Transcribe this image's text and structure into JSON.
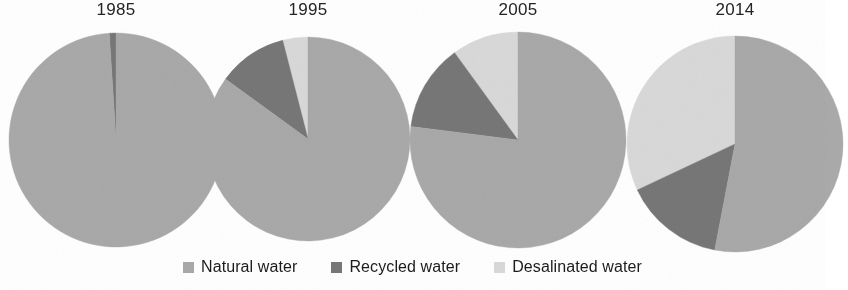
{
  "chart_data": {
    "type": "pie",
    "title": "",
    "subtitle": "",
    "xlabel": "",
    "ylabel": "",
    "grid": false,
    "legend_position": "bottom",
    "direction": "counterclockwise",
    "start_angle_deg": 90,
    "categories": [
      "Natural water",
      "Recycled water",
      "Desalinated water"
    ],
    "colors": {
      "natural_water": "#a9a9a9",
      "recycled_water": "#777777",
      "desalinated_water": "#d9d9d9"
    },
    "panels": [
      {
        "title": "1985",
        "center": {
          "x": 116,
          "y": 140
        },
        "radius": 107,
        "slices": [
          {
            "label": "Desalinated water",
            "value": 0,
            "color_key": "desalinated_water"
          },
          {
            "label": "Recycled water",
            "value": 1,
            "color_key": "recycled_water"
          },
          {
            "label": "Natural water",
            "value": 99,
            "color_key": "natural_water"
          }
        ]
      },
      {
        "title": "1995",
        "center": {
          "x": 308,
          "y": 139
        },
        "radius": 102,
        "slices": [
          {
            "label": "Desalinated water",
            "value": 4,
            "color_key": "desalinated_water"
          },
          {
            "label": "Recycled water",
            "value": 11,
            "color_key": "recycled_water"
          },
          {
            "label": "Natural water",
            "value": 85,
            "color_key": "natural_water"
          }
        ]
      },
      {
        "title": "2005",
        "center": {
          "x": 518,
          "y": 140
        },
        "radius": 108,
        "slices": [
          {
            "label": "Desalinated water",
            "value": 10,
            "color_key": "desalinated_water"
          },
          {
            "label": "Recycled water",
            "value": 13,
            "color_key": "recycled_water"
          },
          {
            "label": "Natural water",
            "value": 77,
            "color_key": "natural_water"
          }
        ]
      },
      {
        "title": "2014",
        "center": {
          "x": 735,
          "y": 144
        },
        "radius": 108,
        "slices": [
          {
            "label": "Desalinated water",
            "value": 32,
            "color_key": "desalinated_water"
          },
          {
            "label": "Recycled water",
            "value": 15,
            "color_key": "recycled_water"
          },
          {
            "label": "Natural water",
            "value": 53,
            "color_key": "natural_water"
          }
        ]
      }
    ]
  },
  "legend": {
    "items": [
      {
        "label": "Natural water",
        "color_key": "natural_water",
        "swatch_name": "legend-swatch-natural-water"
      },
      {
        "label": "Recycled water",
        "color_key": "recycled_water",
        "swatch_name": "legend-swatch-recycled-water"
      },
      {
        "label": "Desalinated water",
        "color_key": "desalinated_water",
        "swatch_name": "legend-swatch-desalinated-water"
      }
    ]
  }
}
